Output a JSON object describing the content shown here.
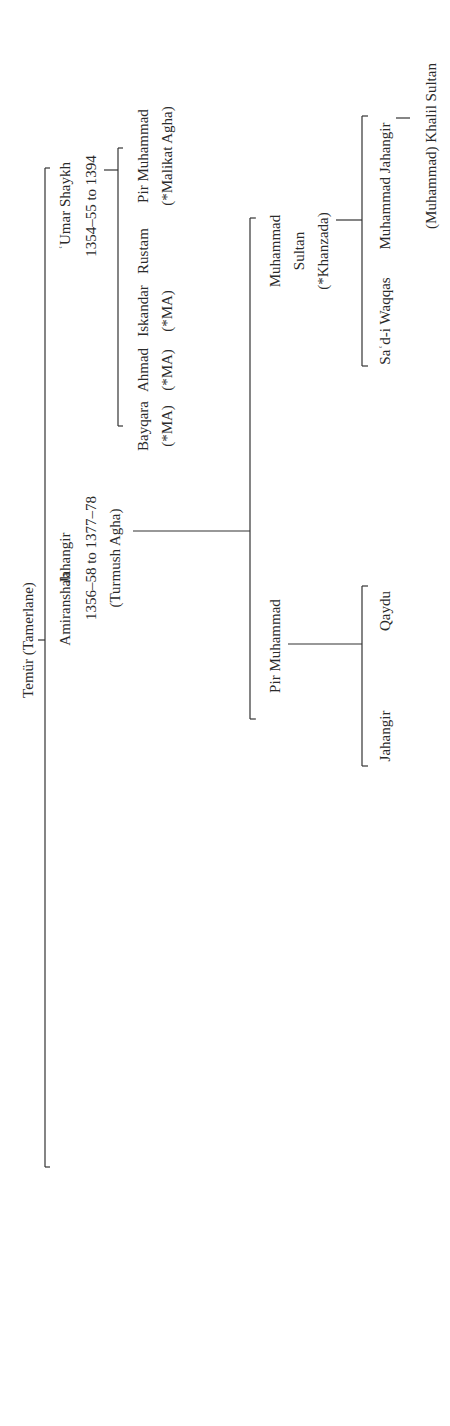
{
  "diagram": {
    "type": "genealogy-tree",
    "orientation": "rotated-90-ccw",
    "root": {
      "name": "Temür (Tamerlane)",
      "children": [
        {
          "name": "ʿUmar Shaykh",
          "dates": "1354–55 to 1394",
          "children": [
            {
              "name": "Pir Muhammad",
              "note": "(*Malikat Agha)"
            },
            {
              "name": "Rustam"
            },
            {
              "name": "Iskandar",
              "note": "(*MA)"
            },
            {
              "name": "Ahmad",
              "note": "(*MA)"
            },
            {
              "name": "Bayqara",
              "note": "(*MA)"
            }
          ]
        },
        {
          "name": "Jahangir",
          "dates": "1356–58 to 1377–78",
          "note": "(Turmush Agha)",
          "children": [
            {
              "name": "Muhammad Sultan",
              "note": "(*Khanzada)",
              "children": [
                {
                  "name": "Muhammad Jahangir",
                  "children": [
                    {
                      "name": "(Muhammad) Khalil Sultan"
                    }
                  ]
                },
                {
                  "name": "Saʿd-i Waqqas"
                }
              ]
            },
            {
              "name": "Pir Muhammad",
              "children": [
                {
                  "name": "Qaydu"
                },
                {
                  "name": "Jahangir"
                }
              ]
            }
          ]
        },
        {
          "name": "Amiranshah",
          "dates": "c. 1366–67 to 1408",
          "children": [
            {
              "name": "Aba Bakr"
            },
            {
              "name": "ʿUmar"
            },
            {
              "name": "Khalil Sultan",
              "note": "(*Khanzada)",
              "children": [
                {
                  "name": "Abu Saʿid"
                }
              ]
            },
            {
              "name": "Sultan Muhammad"
            },
            {
              "name": "Ichil"
            }
          ]
        },
        {
          "name": "Shahrukh",
          "dates": "1377–1447",
          "children": [
            {
              "name": "Ulugh Beg",
              "note": "(Gawharshad)",
              "children": [
                {
                  "name": "ʿAbd al-Latif"
                },
                {
                  "name": "ʿAbd al-ʿAziz"
                }
              ]
            },
            {
              "name": "Ibrahim",
              "children": [
                {
                  "name": "ʿAbd Allah"
                }
              ]
            },
            {
              "name": "Baysunghur",
              "note": "(Gawharshad)",
              "children": [
                {
                  "name": "ʿAlaʾ al-Dawla"
                },
                {
                  "name": "Sultan Muhammad"
                },
                {
                  "name": "Abuʾl Qasim Babur"
                }
              ]
            },
            {
              "name": "Soyurghatmish",
              "note": "(*MA)"
            },
            {
              "name": "Muhammad Juki",
              "children": [
                {
                  "name": "Aba Bakr"
                }
              ]
            }
          ]
        }
      ]
    }
  },
  "labels": {
    "temur": "Temür (Tamerlane)",
    "umar_shaykh": "ʿUmar Shaykh",
    "umar_shaykh_dates": "1354–55 to 1394",
    "jahangir": "Jahangir",
    "jahangir_dates": "1356–58 to 1377–78",
    "jahangir_mother": "(Turmush Agha)",
    "amiranshah": "Amiranshah",
    "amiranshah_dates": "c. 1366–67 to 1408",
    "shahrukh": "Shahrukh",
    "shahrukh_dates": "1377–1447",
    "pir_muhammad_1": "Pir Muhammad",
    "malikat_agha": "(*Malikat Agha)",
    "rustam": "Rustam",
    "iskandar": "Iskandar",
    "ma_1": "(*MA)",
    "ahmad": "Ahmad",
    "ma_2": "(*MA)",
    "bayqara": "Bayqara",
    "ma_3": "(*MA)",
    "muhammad_sultan_1": "Muhammad",
    "muhammad_sultan_2": "Sultan",
    "khanzada_1": "(*Khanzada)",
    "pir_muhammad_2": "Pir Muhammad",
    "muhammad_jahangir": "Muhammad Jahangir",
    "khalil_sultan_2": "(Muhammad) Khalil Sultan",
    "sadi_waqqas": "Saʿd-i Waqqas",
    "qaydu": "Qaydu",
    "jahangir_2": "Jahangir",
    "aba_bakr_1": "Aba Bakr",
    "umar": "ʿUmar",
    "khalil_sultan_1": "Khalil Sultan",
    "khanzada_2": "(*Khanzada)",
    "abu_said": "Abu Saʿid",
    "sultan_muhammad_1": "Sultan Muhammad",
    "ichil": "Ichil",
    "ulugh_beg": "Ulugh Beg",
    "gawharshad_1": "(Gawharshad)",
    "abd_al_latif": "ʿAbd al-Latif",
    "abd_al_aziz": "ʿAbd al-ʿAziz",
    "ibrahim": "Ibrahim",
    "abd_allah": "ʿAbd Allah",
    "baysunghur": "Baysunghur",
    "gawharshad_2": "(Gawharshad)",
    "ala_al_dawla": "ʿAlaʾ al-Dawla",
    "sultan_muhammad_2a": "Sultan",
    "sultan_muhammad_2b": "Muhammad",
    "abul_qasim": "Abuʾl Qasim",
    "babur": "Babur",
    "soyurghatmish": "Soyurghatmish",
    "ma_4": "(*MA)",
    "muhammad_juki_1": "Muhammad",
    "muhammad_juki_2": "Juki",
    "aba_bakr_2": "Aba Bakr"
  }
}
